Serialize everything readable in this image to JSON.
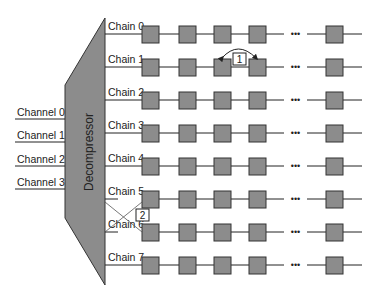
{
  "diagram": {
    "decompressor": {
      "label": "Decompressor",
      "fill": "#8c8c8c"
    },
    "channels": [
      {
        "label": "Channel 0"
      },
      {
        "label": "Channel 1"
      },
      {
        "label": "Channel 2"
      },
      {
        "label": "Channel 3"
      }
    ],
    "chains": [
      {
        "label": "Chain 0"
      },
      {
        "label": "Chain 1"
      },
      {
        "label": "Chain 2"
      },
      {
        "label": "Chain 3"
      },
      {
        "label": "Chain 4"
      },
      {
        "label": "Chain 5"
      },
      {
        "label": "Chain 6"
      },
      {
        "label": "Chain 7"
      }
    ],
    "cells_per_chain_visible": 5,
    "ellipsis": "•••",
    "cell_fill": "#8c8c8c",
    "annotations": [
      {
        "id": "1",
        "label": "1",
        "description": "swap arrow between cells 3 and 4 of Chain 1"
      },
      {
        "id": "2",
        "label": "2",
        "description": "crossed connections between Chain 5 and Chain 6"
      }
    ]
  }
}
